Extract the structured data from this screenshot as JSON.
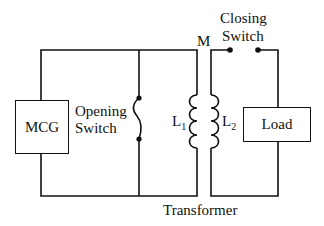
{
  "diagram": {
    "type": "circuit",
    "components": {
      "mcg": {
        "label": "MCG"
      },
      "opening_switch": {
        "line1": "Opening",
        "line2": "Switch"
      },
      "transformer": {
        "label": "Transformer",
        "mutual": "M",
        "primary": "L",
        "primary_sub": "1",
        "secondary": "L",
        "secondary_sub": "2"
      },
      "closing_switch": {
        "line1": "Closing",
        "line2": "Switch"
      },
      "load": {
        "label": "Load"
      }
    },
    "colors": {
      "line": "#111111",
      "background": "#ffffff"
    }
  }
}
